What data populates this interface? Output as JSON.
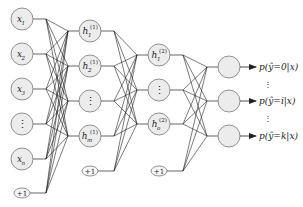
{
  "diagram": {
    "type": "feedforward-neural-network",
    "colors": {
      "node_fill": "#ececec",
      "node_stroke": "#777777",
      "edge": "#222222",
      "text": "#222222"
    },
    "layers": [
      {
        "name": "input",
        "x": 22,
        "nodes": [
          {
            "id": "x1",
            "label": "x",
            "sub": "1",
            "y": 19
          },
          {
            "id": "x2",
            "label": "x",
            "sub": "2",
            "y": 54
          },
          {
            "id": "x3",
            "label": "x",
            "sub": "3",
            "y": 89
          },
          {
            "id": "xdots",
            "label": "⋮",
            "sub": "",
            "y": 124
          },
          {
            "id": "xn",
            "label": "x",
            "sub": "n",
            "y": 159
          }
        ],
        "bias": {
          "label": "+1",
          "y": 193
        }
      },
      {
        "name": "hidden1",
        "x": 90,
        "nodes": [
          {
            "id": "h1_1",
            "label": "h",
            "sub": "1",
            "sup": "(1)",
            "y": 31
          },
          {
            "id": "h1_2",
            "label": "h",
            "sub": "2",
            "sup": "(1)",
            "y": 66
          },
          {
            "id": "h1_dots",
            "label": "⋮",
            "sub": "",
            "sup": "",
            "y": 101
          },
          {
            "id": "h1_m",
            "label": "h",
            "sub": "m",
            "sup": "(1)",
            "y": 136
          }
        ],
        "bias": {
          "label": "+1",
          "y": 171
        }
      },
      {
        "name": "hidden2",
        "x": 159,
        "nodes": [
          {
            "id": "h2_1",
            "label": "h",
            "sub": "1",
            "sup": "(2)",
            "y": 55
          },
          {
            "id": "h2_dots",
            "label": "⋮",
            "sub": "",
            "sup": "",
            "y": 90
          },
          {
            "id": "h2_o",
            "label": "h",
            "sub": "o",
            "sup": "(2)",
            "y": 124
          }
        ],
        "bias": {
          "label": "+1",
          "y": 171
        }
      },
      {
        "name": "output",
        "x": 229,
        "nodes": [
          {
            "id": "y0",
            "y": 67
          },
          {
            "id": "yi",
            "y": 101
          },
          {
            "id": "yk",
            "y": 136
          }
        ]
      }
    ],
    "outputs": [
      {
        "text_pre": "p(",
        "yhat": "ŷ",
        "text_post": "=0|x)",
        "y": 67
      },
      {
        "text_pre": "p(",
        "yhat": "ŷ",
        "text_post": "=i|x)",
        "y": 101
      },
      {
        "text_pre": "p(",
        "yhat": "ŷ",
        "text_post": "=k|x)",
        "y": 136
      }
    ],
    "output_vdots": [
      {
        "text": "⋮",
        "y": 84
      },
      {
        "text": "⋮",
        "y": 118
      }
    ]
  }
}
